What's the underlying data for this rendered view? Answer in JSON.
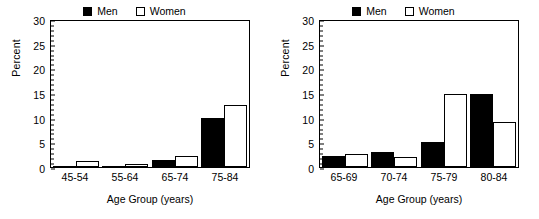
{
  "legend": {
    "men_label": "Men",
    "women_label": "Women",
    "men_color": "#000000",
    "women_color": "#ffffff"
  },
  "axis": {
    "ylabel": "Percent",
    "xlabel": "Age Group (years)",
    "yticks": [
      "0",
      "5",
      "10",
      "15",
      "20",
      "25",
      "30"
    ]
  },
  "chart_data": [
    {
      "type": "bar",
      "title": "",
      "xlabel": "Age Group (years)",
      "ylabel": "Percent",
      "ylim": [
        0,
        30
      ],
      "ytick_values": [
        0,
        5,
        10,
        15,
        20,
        25,
        30
      ],
      "grid": false,
      "legend_position": "top-center",
      "categories": [
        "45-54",
        "55-64",
        "65-74",
        "75-84"
      ],
      "series": [
        {
          "name": "Men",
          "color": "#000000",
          "values": [
            0,
            0.2,
            1.5,
            10
          ]
        },
        {
          "name": "Women",
          "color": "#ffffff",
          "values": [
            1.2,
            0.7,
            2.3,
            12.5
          ]
        }
      ]
    },
    {
      "type": "bar",
      "title": "",
      "xlabel": "Age Group (years)",
      "ylabel": "Percent",
      "ylim": [
        0,
        30
      ],
      "ytick_values": [
        0,
        5,
        10,
        15,
        20,
        25,
        30
      ],
      "grid": false,
      "legend_position": "top-center",
      "categories": [
        "65-69",
        "70-74",
        "75-79",
        "80-84"
      ],
      "series": [
        {
          "name": "Men",
          "color": "#000000",
          "values": [
            2.2,
            3.0,
            5.0,
            14.8
          ]
        },
        {
          "name": "Women",
          "color": "#ffffff",
          "values": [
            2.7,
            2.0,
            14.8,
            9.2
          ]
        }
      ]
    }
  ]
}
